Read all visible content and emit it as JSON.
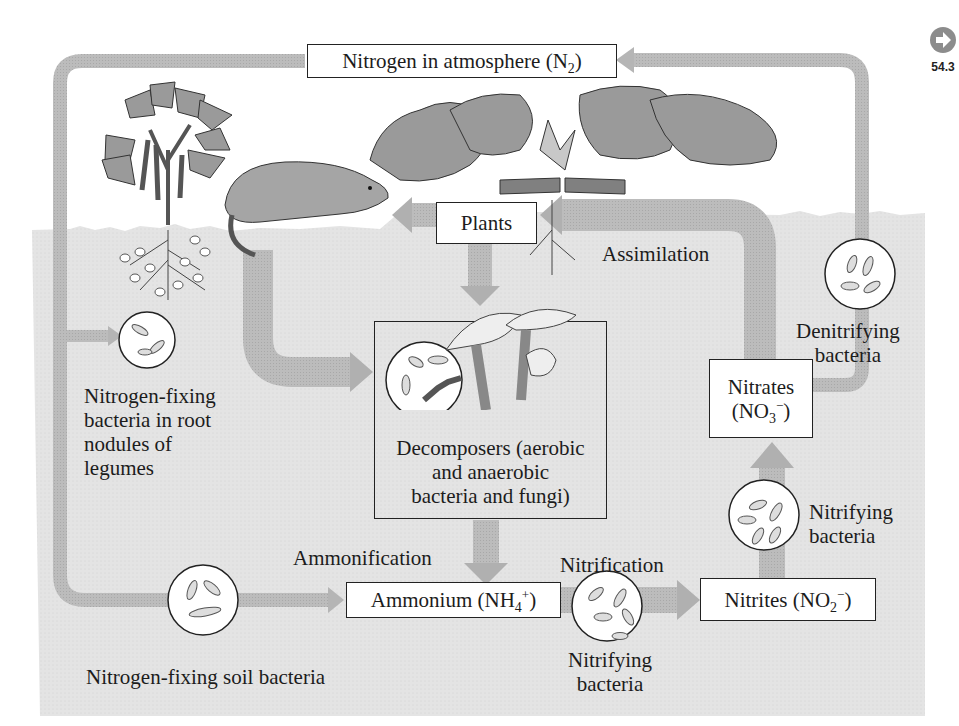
{
  "figure": {
    "reference_badge": {
      "icon": "arrow-right-circle-icon",
      "label": "54.3"
    },
    "colors": {
      "soil": "#e6e6e6",
      "arrow": "#b8b8b8",
      "arrow_dark": "#a9a9a9",
      "leaf": "#9a9a9a",
      "box_border": "#222222",
      "text": "#1c1c1c"
    }
  },
  "nodes": {
    "atmosphere": {
      "text": "Nitrogen in atmosphere (N",
      "sub": "2",
      "close": ")"
    },
    "plants": {
      "text": "Plants"
    },
    "decomposers": {
      "line1": "Decomposers (aerobic",
      "line2": "and anaerobic",
      "line3": "bacteria and fungi)"
    },
    "ammonium": {
      "text": "Ammonium (NH",
      "sub": "4",
      "sup": "+",
      "close": ")"
    },
    "nitrites": {
      "text": "Nitrites (NO",
      "sub": "2",
      "sup": "−",
      "close": ")"
    },
    "nitrates": {
      "line1": "Nitrates",
      "line2_open": "(NO",
      "sub": "3",
      "sup": "−",
      "close": ")"
    }
  },
  "labels": {
    "root_nodule_bacteria": [
      "Nitrogen-fixing",
      "bacteria in root",
      "nodules of",
      "legumes"
    ],
    "soil_bacteria": "Nitrogen-fixing soil bacteria",
    "assimilation": "Assimilation",
    "ammonification": "Ammonification",
    "nitrification": "Nitrification",
    "nitrifying_bottom": [
      "Nitrifying",
      "bacteria"
    ],
    "nitrifying_right": [
      "Nitrifying",
      "bacteria"
    ],
    "denitrifying": [
      "Denitrifying",
      "bacteria"
    ]
  },
  "process_flow": [
    "Nitrogen in atmosphere (N2)",
    "Nitrogen-fixing bacteria in root nodules of legumes",
    "Nitrogen-fixing soil bacteria",
    "Ammonium (NH4+)",
    "Nitrification",
    "Nitrites (NO2-)",
    "Nitrates (NO3-)",
    "Assimilation",
    "Plants",
    "Decomposers (aerobic and anaerobic bacteria and fungi)",
    "Ammonification",
    "Denitrifying bacteria"
  ]
}
